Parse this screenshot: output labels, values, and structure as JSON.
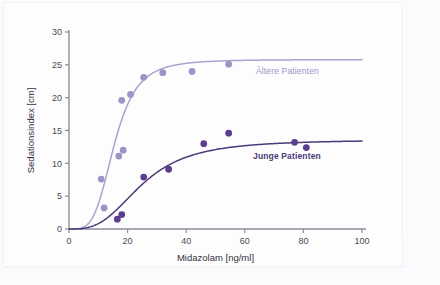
{
  "chart_data": {
    "type": "scatter",
    "title": "",
    "subtitle": "",
    "xlabel": "Midazolam [ng/ml]",
    "ylabel": "Sedationsindex [cm]",
    "xlim": [
      0,
      100
    ],
    "ylim": [
      0,
      30
    ],
    "xticks": [
      0,
      20,
      40,
      60,
      80,
      100
    ],
    "yticks": [
      0,
      5,
      10,
      15,
      20,
      25,
      30
    ],
    "xtick_labels": [
      "0",
      "20",
      "40",
      "60",
      "80",
      "100"
    ],
    "ytick_labels": [
      "0",
      "5",
      "10",
      "15",
      "20",
      "25",
      "30"
    ],
    "grid": false,
    "legend_position": "inline-annotation",
    "series": [
      {
        "name": "Ältere Patienten",
        "color": "#9a95c4",
        "curve_color": "#a9a4cd",
        "marker": "circle",
        "annotation": "Ältere Patienten",
        "fit": {
          "model": "sigmoid-emax",
          "emax": 25.8,
          "ec50": 15.5,
          "hill": 4.0
        },
        "points": [
          {
            "x": 12.0,
            "y": 3.2
          },
          {
            "x": 11.0,
            "y": 7.6
          },
          {
            "x": 17.0,
            "y": 11.1
          },
          {
            "x": 18.5,
            "y": 12.0
          },
          {
            "x": 18.0,
            "y": 19.6
          },
          {
            "x": 21.0,
            "y": 20.5
          },
          {
            "x": 25.5,
            "y": 23.1
          },
          {
            "x": 32.0,
            "y": 23.8
          },
          {
            "x": 42.0,
            "y": 24.0
          },
          {
            "x": 54.5,
            "y": 25.1
          }
        ]
      },
      {
        "name": "Junge Patienten",
        "color": "#5b3f8e",
        "curve_color": "#4b3a78",
        "marker": "circle",
        "annotation": "Junge Patienten",
        "fit": {
          "model": "sigmoid-emax",
          "emax": 13.6,
          "ec50": 25.0,
          "hill": 3.0
        },
        "points": [
          {
            "x": 16.5,
            "y": 1.5
          },
          {
            "x": 18.0,
            "y": 2.2
          },
          {
            "x": 25.5,
            "y": 7.9
          },
          {
            "x": 34.0,
            "y": 9.1
          },
          {
            "x": 46.0,
            "y": 13.0
          },
          {
            "x": 54.5,
            "y": 14.6
          },
          {
            "x": 77.0,
            "y": 13.2
          },
          {
            "x": 81.0,
            "y": 12.4
          }
        ]
      }
    ],
    "axis_color": "#8d8d9c",
    "tick_label_color": "#4a4a55",
    "axis_label_color": "#33333c"
  }
}
